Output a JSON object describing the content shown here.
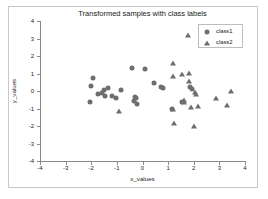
{
  "chart_data": {
    "type": "scatter",
    "title": "Transformed samples with class labels",
    "xlabel": "x_values",
    "ylabel": "y_values",
    "xlim": [
      -4,
      4
    ],
    "ylim": [
      -4,
      4
    ],
    "xticks": [
      -4,
      -3,
      -2,
      -1,
      0,
      1,
      2,
      3,
      4
    ],
    "yticks": [
      -4,
      -3,
      -2,
      -1,
      0,
      1,
      2,
      3,
      4
    ],
    "xtick_labels": [
      "-4",
      "-3",
      "-2",
      "-1",
      "0",
      "1",
      "2",
      "3",
      "4"
    ],
    "ytick_labels": [
      "-4",
      "-3",
      "-2",
      "-1",
      "0",
      "1",
      "2",
      "3",
      "4"
    ],
    "grid": false,
    "legend_position": "upper right",
    "marker_color": "#6e6e6e",
    "series": [
      {
        "name": "class1",
        "marker": "circle",
        "points": [
          [
            -2.05,
            -0.65
          ],
          [
            -2.0,
            0.3
          ],
          [
            -1.95,
            0.72
          ],
          [
            -1.75,
            -0.15
          ],
          [
            -1.6,
            -0.12
          ],
          [
            -1.5,
            0.05
          ],
          [
            -1.45,
            -0.3
          ],
          [
            -1.35,
            0.18
          ],
          [
            -1.2,
            -0.3
          ],
          [
            -1.05,
            -0.4
          ],
          [
            -0.85,
            0.05
          ],
          [
            -0.4,
            1.32
          ],
          [
            -0.35,
            -0.55
          ],
          [
            -0.3,
            -0.32
          ],
          [
            -0.25,
            -0.42
          ],
          [
            -0.2,
            -0.72
          ],
          [
            0.1,
            1.28
          ],
          [
            0.45,
            0.45
          ],
          [
            0.72,
            0.22
          ],
          [
            0.8,
            0.18
          ],
          [
            1.15,
            -1.05
          ],
          [
            1.55,
            -0.62
          ],
          [
            1.85,
            0.25
          ],
          [
            1.95,
            0.1
          ]
        ]
      },
      {
        "name": "class2",
        "marker": "triangle",
        "points": [
          [
            -0.9,
            -1.12
          ],
          [
            1.2,
            1.62
          ],
          [
            1.2,
            0.88
          ],
          [
            1.2,
            -1.0
          ],
          [
            1.22,
            -1.82
          ],
          [
            1.55,
            1.0
          ],
          [
            1.6,
            -0.5
          ],
          [
            1.62,
            -0.62
          ],
          [
            1.78,
            3.2
          ],
          [
            1.8,
            1.05
          ],
          [
            1.82,
            0.55
          ],
          [
            1.9,
            -0.9
          ],
          [
            2.0,
            -1.98
          ],
          [
            2.05,
            -0.05
          ],
          [
            2.1,
            -0.15
          ],
          [
            2.15,
            -0.85
          ],
          [
            2.85,
            -0.38
          ],
          [
            3.3,
            -0.82
          ],
          [
            3.45,
            0.02
          ]
        ]
      }
    ]
  }
}
